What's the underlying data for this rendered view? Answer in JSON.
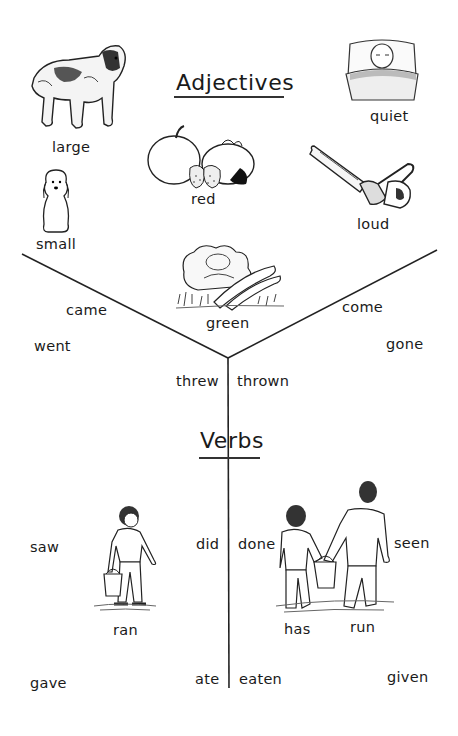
{
  "adjectives": {
    "heading": "Adjectives",
    "words": {
      "large": "large",
      "quiet": "quiet",
      "red": "red",
      "small": "small",
      "loud": "loud",
      "green": "green"
    }
  },
  "verbs": {
    "heading": "Verbs",
    "left": {
      "came": "came",
      "went": "went",
      "threw": "threw",
      "saw": "saw",
      "did": "did",
      "ran": "ran",
      "gave": "gave",
      "ate": "ate"
    },
    "right": {
      "come": "come",
      "gone": "gone",
      "thrown": "thrown",
      "done": "done",
      "seen": "seen",
      "has": "has",
      "run": "run",
      "eaten": "eaten",
      "given": "given"
    }
  },
  "illustrations": {
    "dog_large": "st-bernard-dog-icon",
    "baby_quiet": "sleeping-baby-icon",
    "fruit_red": "apple-tomato-strawberries-icon",
    "dog_small": "poodle-icon",
    "chainsaw_loud": "chainsaw-icon",
    "vegetables_green": "lettuce-peapods-icon",
    "boy_bucket": "boy-carrying-bucket-icon",
    "two_boys_bucket": "two-boys-carrying-bucket-icon"
  }
}
